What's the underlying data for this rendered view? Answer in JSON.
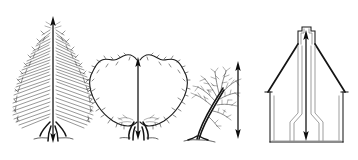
{
  "figure": {
    "canvas": {
      "width": 358,
      "height": 160,
      "background": "#ffffff"
    },
    "ink_color": "#1a1a1a",
    "subjects": [
      {
        "index": 1,
        "name": "conifer-tree",
        "label": "Conifer (spruce/fir)",
        "crown_style": "needled, narrow conical",
        "arrow": {
          "type": "double-headed-vertical",
          "x": 53,
          "top_y": 16,
          "bottom_y": 143,
          "head_top": "up",
          "head_bottom": "down"
        }
      },
      {
        "index": 2,
        "name": "deciduous-tree",
        "label": "Broadleaf deciduous tree",
        "crown_style": "rounded heart-shaped scribbled foliage",
        "arrow": {
          "type": "double-headed-vertical",
          "x": 138,
          "top_y": 57,
          "bottom_y": 140,
          "head_top": "up",
          "head_bottom": "down"
        }
      },
      {
        "index": 3,
        "name": "bare-leaning-tree",
        "label": "Bare leaning tree",
        "crown_style": "open branching, no foliage",
        "arrow": {
          "type": "double-headed-vertical",
          "x": 238,
          "top_y": 61,
          "bottom_y": 139,
          "head_top": "up",
          "head_bottom": "down"
        }
      },
      {
        "index": 4,
        "name": "house-building",
        "label": "Gabled house with chimney",
        "crown_style": "architectural elevation",
        "arrow": {
          "type": "double-headed-vertical",
          "x": 306,
          "top_y": 30,
          "bottom_y": 141,
          "head_top": "up",
          "head_bottom": "down"
        }
      }
    ]
  }
}
